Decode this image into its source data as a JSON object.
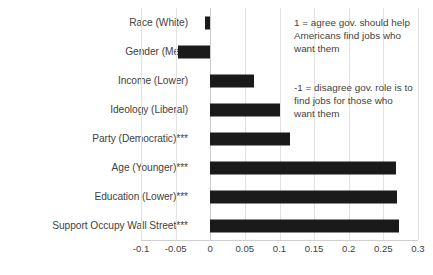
{
  "chart_data": {
    "type": "bar",
    "orientation": "horizontal",
    "title": "",
    "xlabel": "",
    "ylabel": "",
    "xlim": [
      -0.1,
      0.3
    ],
    "xticks": [
      -0.1,
      -0.05,
      0,
      0.05,
      0.1,
      0.15,
      0.2,
      0.25,
      0.3
    ],
    "xtick_labels": [
      "-0.1",
      "-0.05",
      "0",
      "0.05",
      "0.1",
      "0.15",
      "0.2",
      "0.25",
      "0.3"
    ],
    "grid": true,
    "legend": null,
    "bar_color": "#1a1a1a",
    "categories": [
      "Race (White)",
      "Gender (Men)",
      "Income (Lower)",
      "Ideology (Liberal)",
      "Party (Democratic)***",
      "Age (Younger)***",
      "Education (Lower)***",
      "Support Occupy Wall Street***"
    ],
    "values": [
      -0.008,
      -0.046,
      0.063,
      0.1,
      0.115,
      0.268,
      0.27,
      0.272
    ],
    "annotations": [
      {
        "name": "agree-note",
        "lines": [
          "1 = agree gov. should help",
          "Americans find jobs who",
          "want them"
        ]
      },
      {
        "name": "disagree-note",
        "lines": [
          "-1 = disagree gov. role is to",
          "find jobs for those who",
          "want them"
        ]
      }
    ]
  }
}
